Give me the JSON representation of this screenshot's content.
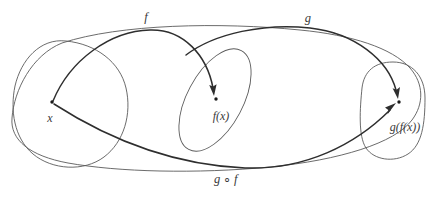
{
  "diagram": {
    "kind": "function-composition-mapping-diagram",
    "stroke_colors": {
      "arc": "#2e2e2e",
      "blob_outline": "#5a5a5a",
      "dot": "#1a1a1a",
      "label_text": "#3a3a3a",
      "background": "#ffffff"
    },
    "sets": [
      {
        "name": "domain-set",
        "shape": "rounded-blob",
        "cx": 70,
        "cy": 104,
        "rx": 57,
        "ry": 64
      },
      {
        "name": "codomain-set-middle",
        "shape": "tilted-ellipse",
        "cx": 215,
        "cy": 100,
        "rx": 28,
        "ry": 57,
        "rotation_deg": 28
      },
      {
        "name": "codomain-set-right",
        "shape": "vertical-rounded-blob",
        "cx": 393,
        "cy": 110,
        "rx": 33,
        "ry": 48
      },
      {
        "name": "outer-set",
        "shape": "wide-enclosing-blob",
        "cx": 205,
        "cy": 100,
        "rx": 195,
        "ry": 72
      }
    ],
    "points": [
      {
        "name": "point-x",
        "label": "x",
        "x": 52,
        "y": 102,
        "label_x": 50,
        "label_y": 118
      },
      {
        "name": "point-fx",
        "label": "f(x)",
        "x": 216,
        "y": 99,
        "label_x": 221,
        "label_y": 116
      },
      {
        "name": "point-gfx",
        "label": "g(f(x))",
        "x": 399,
        "y": 102,
        "label_x": 405,
        "label_y": 127
      }
    ],
    "arrows": [
      {
        "name": "arrow-f",
        "label": "f",
        "from": "point-x",
        "to": "point-fx",
        "label_x": 146,
        "label_y": 17
      },
      {
        "name": "arrow-g",
        "label": "g",
        "from": "point-fx",
        "to": "point-gfx",
        "label_x": 308,
        "label_y": 18
      },
      {
        "name": "arrow-g-compose-f",
        "label": "g ∘ f",
        "label_parts": {
          "left": "g",
          "op": "∘",
          "right": "f"
        },
        "from": "point-x",
        "to": "point-gfx",
        "label_x": 226,
        "label_y": 179
      }
    ],
    "labels": {
      "f": "f",
      "g": "g",
      "x": "x",
      "fx": "f(x)",
      "gfx": "g(f(x))",
      "composition_left": "g",
      "composition_op": "∘",
      "composition_right": "f"
    }
  }
}
